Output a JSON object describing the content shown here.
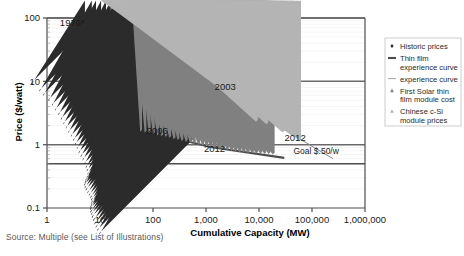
{
  "figure": {
    "source_note": "Source: Multiple (see List of Illustrations)"
  },
  "chart_data": {
    "type": "scatter",
    "title": "",
    "xlabel": "Cumulative Capacity (MW)",
    "ylabel": "Price ($/watt)",
    "xscale": "log",
    "yscale": "log",
    "xlim": [
      1,
      1000000
    ],
    "ylim": [
      0.1,
      100
    ],
    "xticks": [
      "1",
      "10",
      "100",
      "1,000",
      "10,000",
      "100,000",
      "1,000,000"
    ],
    "xtick_values": [
      1,
      10,
      100,
      1000,
      10000,
      100000,
      1000000
    ],
    "yticks": [
      "100",
      "10",
      "1",
      "0.1"
    ],
    "ytick_values": [
      100,
      10,
      1,
      0.1
    ],
    "grid": "horizontal-major",
    "legend_position": "right-outside",
    "annotations": [
      {
        "text": "1976*",
        "x": 3.0,
        "y": 74,
        "name": "anno-1976"
      },
      {
        "text": "2003",
        "x": 2300,
        "y": 7.2,
        "name": "anno-2003"
      },
      {
        "text": "2012",
        "x": 48000,
        "y": 1.15,
        "name": "anno-2012-csi"
      },
      {
        "text": "2006",
        "x": 120,
        "y": 1.45,
        "name": "anno-2006"
      },
      {
        "text": "2012",
        "x": 1450,
        "y": 0.78,
        "name": "anno-2012-thinfilm"
      },
      {
        "text": "Goal $.50/w",
        "x": 120000,
        "y": 0.7,
        "name": "anno-goal"
      }
    ],
    "reference_lines": [
      {
        "name": "goal-line",
        "y": 0.5,
        "label": "Goal $.50/w",
        "color": "#4d4d4d"
      }
    ],
    "series": [
      {
        "name": "Historic prices",
        "type": "scatter",
        "marker": "diamond",
        "color": "#2b2b2b",
        "points": [
          [
            5.2,
            62
          ],
          [
            7.0,
            46
          ],
          [
            8.4,
            40
          ],
          [
            10.5,
            33
          ],
          [
            13.0,
            29
          ],
          [
            16.0,
            26
          ],
          [
            19.5,
            23
          ],
          [
            24.0,
            21
          ],
          [
            29.0,
            19.2
          ],
          [
            35.0,
            17.5
          ],
          [
            42.0,
            16.0
          ],
          [
            50.0,
            14.6
          ],
          [
            60.0,
            13.4
          ],
          [
            72.0,
            12.6
          ],
          [
            86.0,
            11.8
          ],
          [
            103,
            11.0
          ],
          [
            120,
            10.2
          ],
          [
            140,
            9.5
          ],
          [
            165,
            8.9
          ],
          [
            195,
            8.5
          ],
          [
            225,
            8.2
          ],
          [
            260,
            8.0
          ],
          [
            300,
            8.2
          ],
          [
            340,
            8.6
          ],
          [
            380,
            8.8
          ],
          [
            420,
            9.0
          ],
          [
            470,
            8.8
          ],
          [
            520,
            8.5
          ],
          [
            580,
            8.0
          ],
          [
            650,
            7.6
          ],
          [
            720,
            7.2
          ],
          [
            800,
            7.0
          ],
          [
            890,
            6.9
          ],
          [
            980,
            7.0
          ],
          [
            1080,
            7.2
          ],
          [
            1200,
            7.3
          ],
          [
            1350,
            7.2
          ],
          [
            1500,
            7.0
          ],
          [
            1700,
            6.8
          ],
          [
            1950,
            6.5
          ],
          [
            2250,
            6.2
          ],
          [
            2600,
            5.9
          ],
          [
            3000,
            5.6
          ],
          [
            3500,
            5.2
          ]
        ]
      },
      {
        "name": "experience curve",
        "type": "line",
        "color": "#8a8a8a",
        "points": [
          [
            5.5,
            52
          ],
          [
            1000,
            9.2
          ],
          [
            250000,
            0.6
          ]
        ]
      },
      {
        "name": "Thin film experience curve",
        "type": "line",
        "color": "#4d4d4d",
        "points": [
          [
            55,
            1.75
          ],
          [
            1200,
            0.92
          ],
          [
            30000,
            0.62
          ]
        ]
      },
      {
        "name": "First Solar thin film module cost",
        "type": "scatter",
        "marker": "triangle",
        "color": "#808080",
        "points": [
          [
            62,
            1.6
          ],
          [
            75,
            1.55
          ],
          [
            90,
            1.5
          ],
          [
            108,
            1.45
          ],
          [
            130,
            1.4
          ],
          [
            155,
            1.36
          ],
          [
            185,
            1.32
          ],
          [
            220,
            1.28
          ],
          [
            265,
            1.22
          ],
          [
            315,
            1.18
          ],
          [
            375,
            1.14
          ],
          [
            450,
            1.1
          ],
          [
            540,
            1.06
          ],
          [
            640,
            1.02
          ],
          [
            770,
            0.99
          ],
          [
            920,
            0.96
          ],
          [
            1100,
            0.93
          ],
          [
            1320,
            0.9
          ],
          [
            1580,
            0.88
          ],
          [
            1890,
            0.86
          ],
          [
            2260,
            0.84
          ],
          [
            2700,
            0.82
          ],
          [
            3240,
            0.8
          ],
          [
            3880,
            0.78
          ],
          [
            4650,
            0.76
          ],
          [
            5570,
            0.75
          ],
          [
            6670,
            0.74
          ],
          [
            8000,
            0.73
          ],
          [
            9580,
            0.72
          ],
          [
            11470,
            0.72
          ],
          [
            13740,
            0.71
          ],
          [
            16460,
            0.71
          ],
          [
            19700,
            0.7
          ]
        ]
      },
      {
        "name": "Chinese c-Si module prices",
        "type": "scatter",
        "marker": "triangle",
        "color": "#b4b4b4",
        "points": [
          [
            4200,
            4.8
          ],
          [
            5000,
            4.7
          ],
          [
            5700,
            4.9
          ],
          [
            7600,
            4.6
          ],
          [
            10500,
            4.6
          ],
          [
            9500,
            2.3
          ],
          [
            15000,
            2.1
          ],
          [
            30000,
            1.55
          ],
          [
            46000,
            1.35
          ],
          [
            62000,
            1.15
          ]
        ]
      }
    ]
  },
  "legend": {
    "items": [
      {
        "label_lines": [
          "Historic prices"
        ],
        "marker": "diamond",
        "color": "#2b2b2b",
        "name": "legend-historic-prices"
      },
      {
        "label_lines": [
          "Thin film",
          "experience curve"
        ],
        "marker": "thick-line",
        "color": "#4d4d4d",
        "name": "legend-thin-film-curve"
      },
      {
        "label_lines": [
          "experience curve"
        ],
        "marker": "thin-line",
        "color": "#9a9a9a",
        "name": "legend-experience-curve"
      },
      {
        "label_lines": [
          "First Solar thin",
          "film module cost"
        ],
        "marker": "triangle",
        "color": "#808080",
        "name": "legend-first-solar"
      },
      {
        "label_lines": [
          "Chinese c-Si",
          "module prices"
        ],
        "marker": "triangle",
        "color": "#b4b4b4",
        "name": "legend-chinese-csi"
      }
    ]
  }
}
